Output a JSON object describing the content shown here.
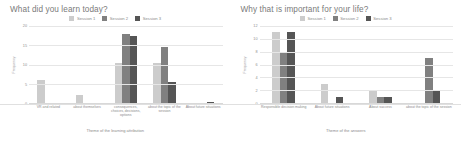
{
  "charts": [
    {
      "title": "What did you learn today?",
      "legend": [
        {
          "label": "Session 1",
          "color": "#cccccc"
        },
        {
          "label": "Session 2",
          "color": "#808080"
        },
        {
          "label": "Session 3",
          "color": "#555555"
        }
      ],
      "ylabel": "Frequency",
      "xlabel": "Theme of the learning attribution",
      "yticks": [
        "20",
        "15",
        "10",
        "5",
        "0"
      ]
    },
    {
      "title": "Why that is important for your life?",
      "legend": [
        {
          "label": "Session 1",
          "color": "#cccccc"
        },
        {
          "label": "Session 2",
          "color": "#808080"
        },
        {
          "label": "Session 3",
          "color": "#555555"
        }
      ],
      "ylabel": "Frequency",
      "xlabel": "Theme of the answers",
      "yticks": [
        "12",
        "10",
        "8",
        "6",
        "4",
        "2",
        "0"
      ]
    }
  ],
  "chart_data": [
    {
      "type": "bar",
      "title": "What did you learn today?",
      "xlabel": "Theme of the learning attribution",
      "ylabel": "Frequency",
      "ylim": [
        0,
        20
      ],
      "yticks": [
        0,
        5,
        10,
        15,
        20
      ],
      "grid": true,
      "legend_position": "top-center",
      "categories": [
        "VR and related",
        "about themselves",
        "consequences, choices, decisions, options",
        "about the topic of the session",
        "About future situations"
      ],
      "series": [
        {
          "name": "Session 1",
          "color": "#cccccc",
          "values": [
            6,
            2,
            10.5,
            10.5,
            0
          ]
        },
        {
          "name": "Session 2",
          "color": "#808080",
          "values": [
            0,
            0,
            18,
            14.5,
            0
          ]
        },
        {
          "name": "Session 3",
          "color": "#555555",
          "values": [
            0,
            0,
            17.5,
            5.5,
            0.3
          ]
        }
      ]
    },
    {
      "type": "bar",
      "title": "Why that is important for your life?",
      "xlabel": "Theme of the answers",
      "ylabel": "Frequency",
      "ylim": [
        0,
        12
      ],
      "yticks": [
        0,
        2,
        4,
        6,
        8,
        10,
        12
      ],
      "grid": true,
      "legend_position": "top-center",
      "categories": [
        "Responsible decision making",
        "About future situations",
        "About success",
        "about the topic of the session"
      ],
      "series": [
        {
          "name": "Session 1",
          "color": "#cccccc",
          "values": [
            11,
            3,
            2,
            0
          ]
        },
        {
          "name": "Session 2",
          "color": "#808080",
          "values": [
            8,
            0,
            1,
            7
          ]
        },
        {
          "name": "Session 3",
          "color": "#555555",
          "values": [
            11,
            1,
            1,
            2
          ]
        }
      ]
    }
  ]
}
